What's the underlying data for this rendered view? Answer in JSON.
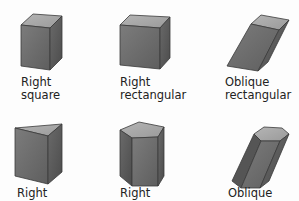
{
  "colors": {
    "background": "#fdfdfd",
    "front_face": "#6f6f6f",
    "side_face": "#5a5a5a",
    "top_face": "#a9a9a9",
    "edge": "#3a3a3a",
    "label_text": "#222222"
  },
  "prisms": [
    {
      "id": "right-square",
      "line1": "Right",
      "line2": "square"
    },
    {
      "id": "right-rectangular",
      "line1": "Right",
      "line2": "rectangular"
    },
    {
      "id": "oblique-rectangular",
      "line1": "Oblique",
      "line2": "rectangular"
    },
    {
      "id": "right-triangular",
      "line1": "Right",
      "line2": ""
    },
    {
      "id": "right-pentagonal",
      "line1": "Right",
      "line2": ""
    },
    {
      "id": "oblique-hexagonal",
      "line1": "Oblique",
      "line2": ""
    }
  ]
}
